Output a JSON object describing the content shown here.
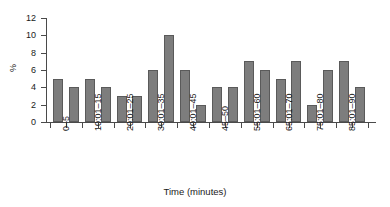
{
  "chart_data": {
    "type": "bar",
    "title": "",
    "xlabel": "Time (minutes)",
    "ylabel": "%",
    "ylim": [
      0,
      12
    ],
    "yticks": [
      0,
      2,
      4,
      6,
      8,
      10,
      12
    ],
    "grid": false,
    "legend": null,
    "categories": [
      "0–5",
      "",
      "10:01–15",
      "",
      "20:01–25",
      "",
      "30:01–35",
      "",
      "40:01–45",
      "",
      "45–50",
      "",
      "55:01–60",
      "",
      "65:01–70",
      "",
      "75:01–80",
      "",
      "85:01–90",
      ""
    ],
    "tick_labels": [
      "0–5",
      "10:01–15",
      "20:01–25",
      "30:01–35",
      "40:01–45",
      "45–50",
      "55:01–60",
      "65:01–70",
      "75:01–80",
      "85:01–90"
    ],
    "values": [
      5,
      4,
      5,
      4,
      3,
      3,
      6,
      10,
      6,
      2,
      4,
      4,
      7,
      6,
      5,
      7,
      2,
      6,
      7,
      4
    ],
    "bar_color": "#7d7d7d",
    "bar_edge_color": "#5a5a5a",
    "axis_color": "#4a4a4a",
    "background": "#ffffff"
  }
}
